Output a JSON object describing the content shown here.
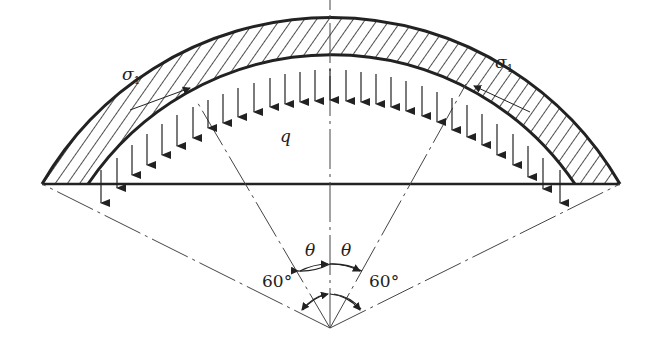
{
  "diagram": {
    "title": "",
    "type": "spherical shell / arch under distributed load",
    "labels": {
      "stress_left": "σ",
      "stress_left_sub": "1",
      "stress_right": "σ",
      "stress_right_sub": "1",
      "load": "q",
      "theta_left": "θ",
      "theta_right": "θ",
      "angle_left": "60°",
      "angle_right": "60°"
    },
    "colors": {
      "line": "#222222",
      "background": "#ffffff"
    },
    "geometry": {
      "center": [
        330,
        328
      ],
      "outer_arc_span": [
        42,
        620
      ],
      "inner_arc_span": [
        88,
        575
      ],
      "half_angle_deg": 60
    }
  }
}
